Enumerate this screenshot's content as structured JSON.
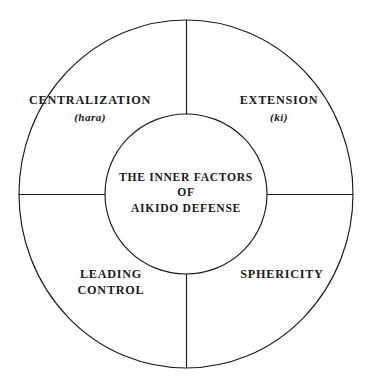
{
  "diagram": {
    "type": "concentric-wheel",
    "title": "The Inner Factors of Aikido Defense",
    "background_color": "#ffffff",
    "stroke_color": "#1a1a1a",
    "text_color": "#1a1a1a",
    "geometry": {
      "outer_circle": {
        "cx": 186,
        "cy": 194,
        "rx": 167,
        "ry": 174
      },
      "inner_circle": {
        "cx": 186,
        "cy": 194,
        "rx": 81,
        "ry": 80
      },
      "divider_count": 4,
      "divider_directions": [
        "up",
        "down",
        "left",
        "right"
      ]
    },
    "center": {
      "lines": [
        "THE INNER FACTORS",
        "OF",
        "AIKIDO DEFENSE"
      ]
    },
    "quadrants": [
      {
        "position": "top-left",
        "primary": "CENTRALIZATION",
        "secondary": "(hara)"
      },
      {
        "position": "top-right",
        "primary": "EXTENSION",
        "secondary": "(ki)"
      },
      {
        "position": "bottom-left",
        "primary": "LEADING",
        "secondary": "CONTROL"
      },
      {
        "position": "bottom-right",
        "primary": "SPHERICITY",
        "secondary": ""
      }
    ]
  }
}
